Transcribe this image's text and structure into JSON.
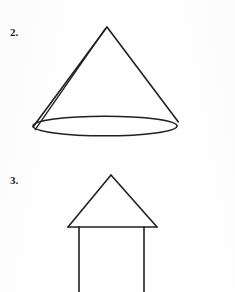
{
  "page": {
    "background_color": "#fefefe",
    "ink_color": "#211f1f",
    "width": 235,
    "height": 292
  },
  "figures": [
    {
      "number_label": "2.",
      "name": "cone",
      "description": "A cone drawn as a triangle whose base is an ellipse, with an extra back slant line on the left side showing the hidden edge.",
      "geometry": {
        "apex": [
          107,
          27
        ],
        "ellipse_center": [
          105,
          126
        ],
        "ellipse_rx": 72,
        "ellipse_ry": 10,
        "left_slant_end": [
          33,
          127
        ],
        "back_slant_end": [
          38,
          130
        ],
        "right_slant_end": [
          178,
          122
        ]
      }
    },
    {
      "number_label": "3.",
      "name": "triangle-on-two-vertical-lines",
      "description": "An arrow or house shape: a triangle resting on a horizontal base line with two vertical lines descending from near its base corners to the bottom edge of the page.",
      "geometry": {
        "apex": [
          111,
          175
        ],
        "base_left": [
          68,
          227
        ],
        "base_right": [
          157,
          227
        ],
        "vertical_left_x": 79,
        "vertical_right_x": 144,
        "vertical_top_y": 227,
        "vertical_bottom_y": 292
      }
    }
  ]
}
